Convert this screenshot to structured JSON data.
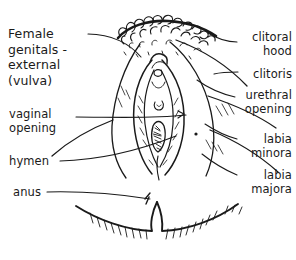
{
  "figure": {
    "title": "Female\ngenitals -\nexternal\n(vulva)",
    "style": "hand-drawn ink line art",
    "ink_color": "#1a1a1a",
    "background_color": "#ffffff"
  },
  "labels": {
    "left": [
      {
        "id": "title",
        "text": "Female\ngenitals -\nexternal\n(vulva)"
      },
      {
        "id": "vaginal-opening",
        "text": "vaginal\nopening"
      },
      {
        "id": "hymen",
        "text": "hymen"
      },
      {
        "id": "anus",
        "text": "anus"
      }
    ],
    "right": [
      {
        "id": "clitoral-hood",
        "text": "clitoral\nhood"
      },
      {
        "id": "clitoris",
        "text": "clitoris"
      },
      {
        "id": "urethral-opening",
        "text": "urethral\nopening"
      },
      {
        "id": "labia-minora",
        "text": "labia\nminora"
      },
      {
        "id": "labia-majora",
        "text": "labia\nmajora"
      }
    ]
  }
}
